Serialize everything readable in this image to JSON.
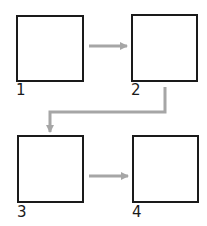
{
  "diagram": {
    "type": "sequence-flow",
    "colors": {
      "box_border": "#1a1a1a",
      "arrow": "#a6a6a6",
      "background": "#ffffff"
    },
    "steps": [
      {
        "id": 1,
        "label": "1"
      },
      {
        "id": 2,
        "label": "2"
      },
      {
        "id": 3,
        "label": "3"
      },
      {
        "id": 4,
        "label": "4"
      }
    ],
    "connections": [
      {
        "from": 1,
        "to": 2
      },
      {
        "from": 2,
        "to": 3
      },
      {
        "from": 3,
        "to": 4
      }
    ]
  }
}
